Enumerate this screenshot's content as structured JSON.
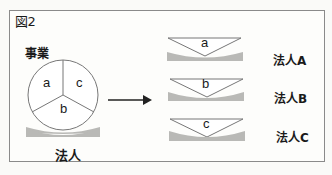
{
  "figure": {
    "label": "図2",
    "left": {
      "title": "事業",
      "segments": [
        "a",
        "c",
        "b"
      ],
      "base_label": "法人"
    },
    "arrow": "right-arrow",
    "right": {
      "items": [
        {
          "segment": "a",
          "label": "法人A"
        },
        {
          "segment": "b",
          "label": "法人B"
        },
        {
          "segment": "c",
          "label": "法人C"
        }
      ]
    },
    "colors": {
      "line": "#666666",
      "base_fill": "#b9b9b6",
      "text": "#1a1a1a"
    }
  }
}
